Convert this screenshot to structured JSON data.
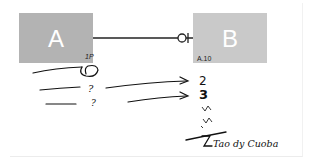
{
  "diagram": {
    "type": "entity-relationship sketch",
    "entities": [
      {
        "id": "A",
        "label": "A",
        "attribute_note": "1P",
        "color": "#b3b3b3"
      },
      {
        "id": "B",
        "label": "B",
        "attribute_note": "A.10",
        "color": "#c9c9c9"
      }
    ],
    "relationship": {
      "from": "A",
      "to": "B",
      "end_symbol": "zero-or-one (circle + bar)"
    },
    "annotations": {
      "left_column": [
        "(loop)",
        "?",
        "?"
      ],
      "right_column": [
        "2",
        "3",
        "~",
        "~"
      ],
      "footer_note": "Tao dy Cuoba"
    }
  }
}
